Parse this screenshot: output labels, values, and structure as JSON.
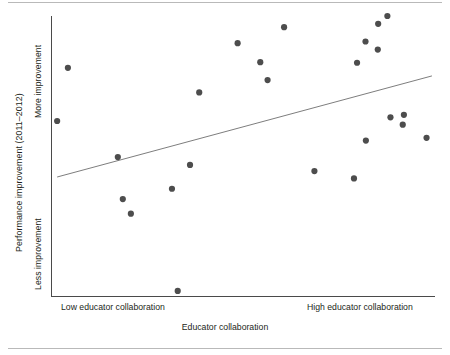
{
  "chart_data": {
    "type": "scatter",
    "title": "",
    "xlabel": "Educator collaboration",
    "ylabel": "Performance improvement (2011–2012)",
    "xtick_labels": [
      "Low educator collaboration",
      "High educator collaboration"
    ],
    "ytick_labels": [
      "More improvement",
      "Less improvement"
    ],
    "xlim": [
      0,
      100
    ],
    "ylim": [
      0,
      100
    ],
    "grid": false,
    "legend": null,
    "axis_color": "#4a4a4a",
    "point_color": "#4d4d4d",
    "trendline_color": "#6e6e6e",
    "point_radius_px": 3.1,
    "points": [
      {
        "x": 1.6,
        "y": 62.5
      },
      {
        "x": 4.4,
        "y": 81.5
      },
      {
        "x": 17.4,
        "y": 49.6
      },
      {
        "x": 18.7,
        "y": 34.6
      },
      {
        "x": 20.8,
        "y": 29.4
      },
      {
        "x": 31.5,
        "y": 38.3
      },
      {
        "x": 38.6,
        "y": 72.7
      },
      {
        "x": 36.2,
        "y": 46.8
      },
      {
        "x": 33.0,
        "y": 1.8
      },
      {
        "x": 48.6,
        "y": 90.3
      },
      {
        "x": 54.5,
        "y": 83.5
      },
      {
        "x": 56.4,
        "y": 77.1
      },
      {
        "x": 60.7,
        "y": 96.0
      },
      {
        "x": 68.6,
        "y": 44.6
      },
      {
        "x": 78.9,
        "y": 42.0
      },
      {
        "x": 79.7,
        "y": 83.3
      },
      {
        "x": 82.0,
        "y": 55.5
      },
      {
        "x": 85.2,
        "y": 97.2
      },
      {
        "x": 81.9,
        "y": 90.9
      },
      {
        "x": 85.1,
        "y": 88.0
      },
      {
        "x": 87.6,
        "y": 100.0
      },
      {
        "x": 88.4,
        "y": 63.8
      },
      {
        "x": 91.9,
        "y": 64.7
      },
      {
        "x": 91.6,
        "y": 61.2
      },
      {
        "x": 97.8,
        "y": 56.5
      }
    ],
    "trendline": {
      "x0": 1.6,
      "y0": 42.5,
      "x1": 99.2,
      "y1": 78.6
    }
  }
}
